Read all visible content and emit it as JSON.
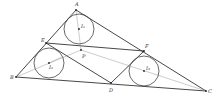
{
  "diagram": {
    "points": {
      "A": {
        "label": "A",
        "x": 76,
        "y": 10
      },
      "B": {
        "label": "B",
        "x": 16,
        "y": 77
      },
      "C": {
        "label": "C",
        "x": 206,
        "y": 91
      },
      "D": {
        "label": "D",
        "x": 111,
        "y": 83
      },
      "E": {
        "label": "E",
        "x": 46,
        "y": 43
      },
      "F": {
        "label": "F",
        "x": 144,
        "y": 51
      },
      "P": {
        "label": "P",
        "x": 81,
        "y": 50
      }
    },
    "circles": [
      {
        "center_label": "I₁",
        "cx": 79,
        "cy": 29,
        "r": 15
      },
      {
        "center_label": "I₂",
        "cx": 49,
        "cy": 63,
        "r": 15
      },
      {
        "center_label": "I₃",
        "cx": 144,
        "cy": 71,
        "r": 15
      }
    ]
  }
}
